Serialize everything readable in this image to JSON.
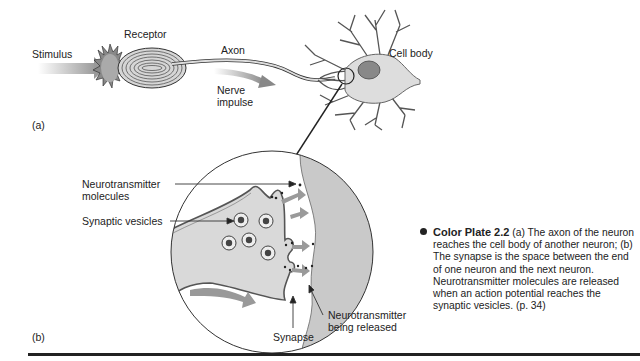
{
  "figure": {
    "panel_a": {
      "marker": "(a)",
      "labels": {
        "stimulus": "Stimulus",
        "receptor": "Receptor",
        "axon": "Axon",
        "nerve_impulse_line1": "Nerve",
        "nerve_impulse_line2": "impulse",
        "cell_body": "Cell body"
      }
    },
    "panel_b": {
      "marker": "(b)",
      "labels": {
        "nt_molecules_line1": "Neurotransmitter",
        "nt_molecules_line2": "molecules",
        "synaptic_vesicles": "Synaptic vesicles",
        "synapse": "Synapse",
        "nt_released_line1": "Neurotransmitter",
        "nt_released_line2": "being released"
      }
    },
    "caption": {
      "title": "Color Plate 2.2",
      "text": " (a) The axon of the neuron reaches the cell body of another neuron; (b) The synapse is the space between the end of one neuron and the next neuron. Neurotransmitter molecules are released when an action potential reaches the synaptic vesicles. (p. 34)"
    },
    "colors": {
      "ink": "#222222",
      "fill_light": "#d9d9d9",
      "fill_mid": "#bdbdbd",
      "arrow_grey": "#9a9a9a"
    }
  }
}
